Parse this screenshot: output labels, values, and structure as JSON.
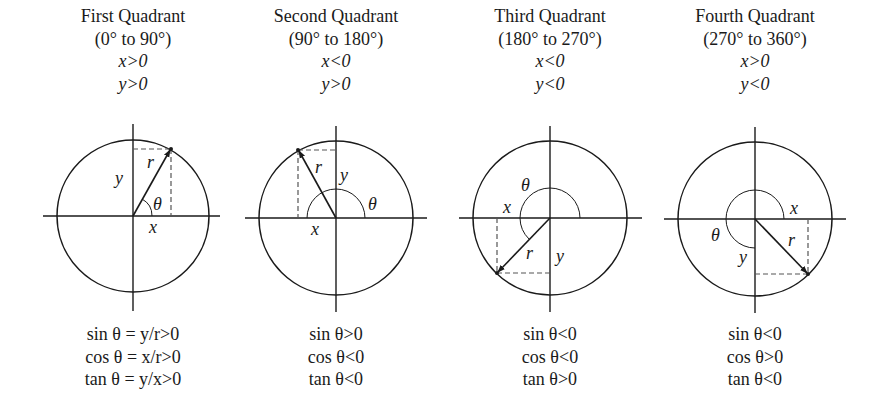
{
  "quadrants": [
    {
      "title": "First Quadrant",
      "range": "(0° to 90°)",
      "x_cond": "x>0",
      "y_cond": "y>0",
      "labels": {
        "x": "x",
        "y": "y",
        "r": "r",
        "theta": "θ"
      },
      "sin": "sin θ = y/r>0",
      "cos": "cos θ = x/r>0",
      "tan": "tan θ = y/x>0"
    },
    {
      "title": "Second Quadrant",
      "range": "(90° to 180°)",
      "x_cond": "x<0",
      "y_cond": "y>0",
      "labels": {
        "x": "x",
        "y": "y",
        "r": "r",
        "theta": "θ"
      },
      "sin": "sin θ>0",
      "cos": "cos θ<0",
      "tan": "tan θ<0"
    },
    {
      "title": "Third Quadrant",
      "range": "(180° to 270°)",
      "x_cond": "x<0",
      "y_cond": "y<0",
      "labels": {
        "x": "x",
        "y": "y",
        "r": "r",
        "theta": "θ"
      },
      "sin": "sin θ<0",
      "cos": "cos θ<0",
      "tan": "tan θ>0"
    },
    {
      "title": "Fourth Quadrant",
      "range": "(270° to 360°)",
      "x_cond": "x>0",
      "y_cond": "y<0",
      "labels": {
        "x": "x",
        "y": "y",
        "r": "r",
        "theta": "θ"
      },
      "sin": "sin θ<0",
      "cos": "cos θ>0",
      "tan": "tan θ<0"
    }
  ],
  "colors": {
    "ink": "#1a1a1a",
    "dash": "#555555",
    "background": "#ffffff"
  }
}
